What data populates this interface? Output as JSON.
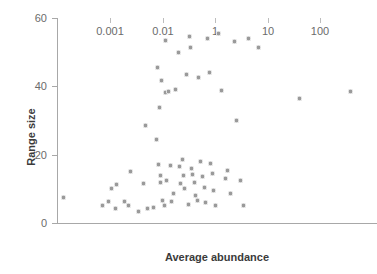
{
  "chart_data": {
    "type": "scatter",
    "title": "",
    "xlabel": "Average abundance",
    "ylabel": "Range size",
    "xscale": "log",
    "yscale": "linear",
    "xticks": [
      0.001,
      0.01,
      1,
      10,
      100
    ],
    "xtick_labels": [
      "0.001",
      "0.01",
      "1",
      "10",
      "100"
    ],
    "yticks": [
      0,
      20,
      40,
      60
    ],
    "ytick_labels": [
      "0",
      "20",
      "40",
      "60"
    ],
    "ylim": [
      0,
      60
    ],
    "grid": false,
    "legend": null,
    "marker": {
      "shape": "circle",
      "color": "#9a9a9a",
      "size_px": 5
    },
    "points": [
      {
        "x": 0.00013,
        "y": 7.6
      },
      {
        "x": 0.00072,
        "y": 5.0
      },
      {
        "x": 0.00092,
        "y": 6.3
      },
      {
        "x": 0.00105,
        "y": 10.0
      },
      {
        "x": 0.00125,
        "y": 4.1
      },
      {
        "x": 0.0013,
        "y": 11.4
      },
      {
        "x": 0.0019,
        "y": 6.2
      },
      {
        "x": 0.0022,
        "y": 5.2
      },
      {
        "x": 0.0024,
        "y": 15.2
      },
      {
        "x": 0.0034,
        "y": 3.4
      },
      {
        "x": 0.0042,
        "y": 11.5
      },
      {
        "x": 0.0046,
        "y": 28.4
      },
      {
        "x": 0.0052,
        "y": 4.2
      },
      {
        "x": 0.0065,
        "y": 4.4
      },
      {
        "x": 0.0075,
        "y": 24.5
      },
      {
        "x": 0.0078,
        "y": 45.5
      },
      {
        "x": 0.0082,
        "y": 17.0
      },
      {
        "x": 0.0085,
        "y": 33.8
      },
      {
        "x": 0.0088,
        "y": 14.0
      },
      {
        "x": 0.0091,
        "y": 12.0
      },
      {
        "x": 0.0095,
        "y": 41.8
      },
      {
        "x": 0.0098,
        "y": 6.6
      },
      {
        "x": 0.011,
        "y": 5.0
      },
      {
        "x": 0.012,
        "y": 53.5
      },
      {
        "x": 0.013,
        "y": 38.2
      },
      {
        "x": 0.014,
        "y": 12.5
      },
      {
        "x": 0.016,
        "y": 38.5
      },
      {
        "x": 0.019,
        "y": 16.7
      },
      {
        "x": 0.022,
        "y": 6.4
      },
      {
        "x": 0.026,
        "y": 8.6
      },
      {
        "x": 0.031,
        "y": 39.0
      },
      {
        "x": 0.038,
        "y": 50.0
      },
      {
        "x": 0.042,
        "y": 16.5
      },
      {
        "x": 0.048,
        "y": 11.5
      },
      {
        "x": 0.055,
        "y": 18.5
      },
      {
        "x": 0.062,
        "y": 13.8
      },
      {
        "x": 0.07,
        "y": 10.0
      },
      {
        "x": 0.082,
        "y": 43.5
      },
      {
        "x": 0.092,
        "y": 5.5
      },
      {
        "x": 0.105,
        "y": 54.5
      },
      {
        "x": 0.115,
        "y": 51.5
      },
      {
        "x": 0.125,
        "y": 16.0
      },
      {
        "x": 0.14,
        "y": 14.2
      },
      {
        "x": 0.16,
        "y": 11.8
      },
      {
        "x": 0.18,
        "y": 8.0
      },
      {
        "x": 0.21,
        "y": 6.5
      },
      {
        "x": 0.24,
        "y": 42.5
      },
      {
        "x": 0.28,
        "y": 18.0
      },
      {
        "x": 0.33,
        "y": 13.5
      },
      {
        "x": 0.38,
        "y": 10.5
      },
      {
        "x": 0.44,
        "y": 6.0
      },
      {
        "x": 0.52,
        "y": 54.0
      },
      {
        "x": 0.6,
        "y": 44.0
      },
      {
        "x": 0.68,
        "y": 17.5
      },
      {
        "x": 0.78,
        "y": 14.5
      },
      {
        "x": 0.88,
        "y": 9.5
      },
      {
        "x": 1.0,
        "y": 5.2
      },
      {
        "x": 1.15,
        "y": 55.5
      },
      {
        "x": 1.35,
        "y": 38.8
      },
      {
        "x": 1.55,
        "y": 13.0
      },
      {
        "x": 1.75,
        "y": 15.5
      },
      {
        "x": 2.0,
        "y": 8.5
      },
      {
        "x": 2.3,
        "y": 53.0
      },
      {
        "x": 2.6,
        "y": 30.0
      },
      {
        "x": 3.0,
        "y": 12.5
      },
      {
        "x": 3.4,
        "y": 5.0
      },
      {
        "x": 4.2,
        "y": 54.0
      },
      {
        "x": 6.5,
        "y": 51.5
      },
      {
        "x": 40.0,
        "y": 36.5
      },
      {
        "x": 380.0,
        "y": 38.5
      }
    ]
  }
}
